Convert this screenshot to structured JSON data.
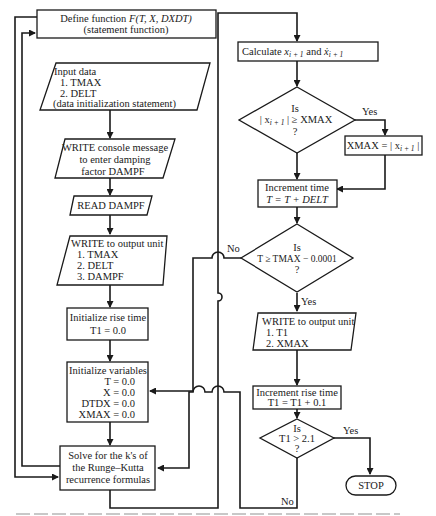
{
  "diagram": {
    "nodes": {
      "define_function": {
        "line1_prefix": "Define function ",
        "line1_func": "F",
        "line1_args": "(T, X, DXDT)",
        "line2": "(statement function)"
      },
      "input_data": {
        "lines": [
          "Input data",
          "1.  TMAX",
          "2.  DELT",
          "(data initialization statement)"
        ]
      },
      "write_console": {
        "lines": [
          "WRITE console message",
          "to enter damping",
          "factor DAMPF"
        ]
      },
      "read_dampf": {
        "label": "READ  DAMPF"
      },
      "write_output_1": {
        "lines": [
          "WRITE to output unit",
          "1.  TMAX",
          "2.  DELT",
          "3.  DAMPF"
        ]
      },
      "init_rise_time": {
        "lines": [
          "Initialize rise time",
          "T1 = 0.0"
        ]
      },
      "init_variables": {
        "lines": [
          "Initialize variables",
          "T = 0.0",
          "X = 0.0",
          "DTDX = 0.0",
          "XMAX = 0.0"
        ]
      },
      "solve_k": {
        "lines": [
          "Solve for the k's of",
          "the Runge–Kutta",
          "recurrence formulas"
        ]
      },
      "calculate": {
        "prefix": "Calculate ",
        "x": "x",
        "sub": "i + 1",
        "mid": " and ",
        "xdot": "ẋ",
        "sub2": "i + 1"
      },
      "decision_xmax": {
        "line1": "Is",
        "line2_a": "| x",
        "line2_sub": "i + 1",
        "line2_b": " | ≥ XMAX",
        "line3": "?"
      },
      "set_xmax": {
        "a": "XMAX = | x",
        "sub": "i + 1",
        "b": " |"
      },
      "increment_time": {
        "lines": [
          "Increment time",
          "T = T + DELT"
        ]
      },
      "decision_tmax": {
        "lines": [
          "Is",
          "T ≥ TMAX − 0.0001",
          "?"
        ]
      },
      "write_output_2": {
        "lines": [
          "WRITE to output unit",
          "1.  T1",
          "2.  XMAX"
        ]
      },
      "increment_rise": {
        "lines": [
          "Increment rise time",
          "T1 = T1 + 0.1"
        ]
      },
      "decision_t1": {
        "lines": [
          "Is",
          "T1 > 2.1",
          "?"
        ]
      },
      "stop": {
        "label": "STOP"
      }
    },
    "edge_labels": {
      "xmax_yes": "Yes",
      "tmax_no": "No",
      "tmax_yes": "Yes",
      "t1_yes": "Yes",
      "t1_no": "No"
    },
    "caption": "Figure 10.14  Flowchart for ... (partially cut off)"
  }
}
